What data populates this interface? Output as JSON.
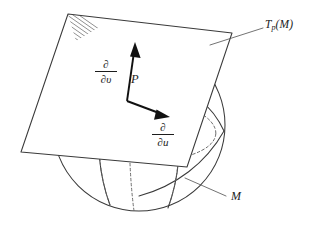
{
  "figure": {
    "background_color": "#ffffff",
    "stroke_color": "#3a3a3a",
    "dashed_color": "#5f5f5f",
    "vector_color": "#111111",
    "width": 318,
    "height": 225
  },
  "labels": {
    "tangent_plane": {
      "base": "T",
      "subscript": "p",
      "argument": "(M)",
      "full_text": "Tp(M)"
    },
    "manifold": "M",
    "point": "P",
    "partial_v": {
      "numerator": "∂",
      "denominator": "∂υ",
      "full_text": "∂/∂υ"
    },
    "partial_u": {
      "numerator": "∂",
      "denominator": "∂u",
      "full_text": "∂/∂u"
    }
  },
  "elements": {
    "sphere_name": "sphere-outline",
    "plane_name": "tangent-plane",
    "hatch_name": "hatched-corner",
    "vector_v_name": "partial-v-vector",
    "vector_u_name": "partial-u-vector",
    "leader_plane_name": "tangent-plane-leader-line",
    "leader_manifold_name": "manifold-leader-line"
  }
}
